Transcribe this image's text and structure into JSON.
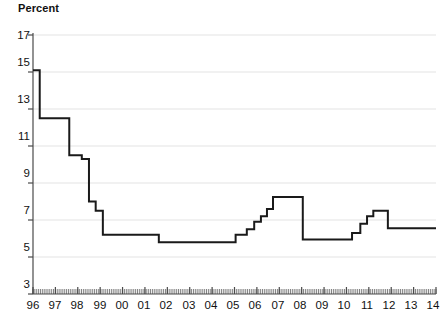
{
  "chart_data": {
    "type": "line",
    "title": "",
    "ylabel": "Percent",
    "xlabel": "",
    "ylim": [
      3,
      17
    ],
    "xlim": [
      1996,
      2014
    ],
    "grid": true,
    "legend": null,
    "line_color": "#1a1a1a",
    "grid_color": "#e3e3e3",
    "axis_color": "#4a4a4a",
    "step_style": "post",
    "y_ticks": [
      3,
      5,
      7,
      9,
      11,
      13,
      15,
      17
    ],
    "y_tick_labels": [
      "3",
      "5",
      "7",
      "9",
      "11",
      "13",
      "15",
      "17"
    ],
    "x_ticks": [
      1996,
      1997,
      1998,
      1999,
      2000,
      2001,
      2002,
      2003,
      2004,
      2005,
      2006,
      2007,
      2008,
      2009,
      2010,
      2011,
      2012,
      2013,
      2014
    ],
    "x_tick_labels": [
      "96",
      "97",
      "98",
      "99",
      "00",
      "01",
      "02",
      "03",
      "04",
      "05",
      "06",
      "07",
      "08",
      "09",
      "10",
      "11",
      "12",
      "13",
      "14"
    ],
    "minor_x_ticks": "monthly",
    "series": [
      {
        "name": "Rate",
        "x": [
          1996.0,
          1996.08,
          1996.3,
          1997.55,
          1997.62,
          1998.1,
          1998.18,
          1998.42,
          1998.5,
          1998.72,
          1998.8,
          1999.05,
          1999.12,
          2001.55,
          2001.62,
          2004.95,
          2005.05,
          2005.45,
          2005.55,
          2005.78,
          2005.88,
          2006.05,
          2006.18,
          2006.35,
          2006.45,
          2006.62,
          2006.72,
          2007.95,
          2008.05,
          2010.05,
          2010.25,
          2010.45,
          2010.62,
          2010.8,
          2010.92,
          2011.1,
          2011.2,
          2011.75,
          2011.85,
          2014.0
        ],
        "values": [
          15.1,
          15.1,
          12.5,
          12.5,
          10.5,
          10.5,
          10.3,
          10.3,
          8.0,
          8.0,
          7.5,
          7.5,
          6.2,
          6.2,
          5.8,
          5.8,
          6.2,
          6.2,
          6.5,
          6.5,
          6.9,
          6.9,
          7.2,
          7.2,
          7.6,
          7.6,
          8.25,
          8.25,
          5.95,
          5.95,
          6.3,
          6.3,
          6.8,
          6.8,
          7.2,
          7.2,
          7.5,
          7.5,
          6.55,
          6.55
        ]
      }
    ]
  },
  "axis": {
    "y_title": "Percent"
  }
}
